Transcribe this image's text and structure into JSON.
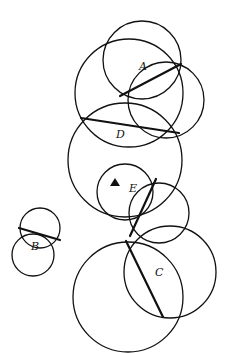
{
  "diagram": {
    "labels": {
      "A": "A",
      "B": "B",
      "C": "C",
      "D": "D",
      "E": "E"
    },
    "marker": "filled-triangle",
    "colors": {
      "stroke": "#111111",
      "background": "#ffffff"
    }
  }
}
